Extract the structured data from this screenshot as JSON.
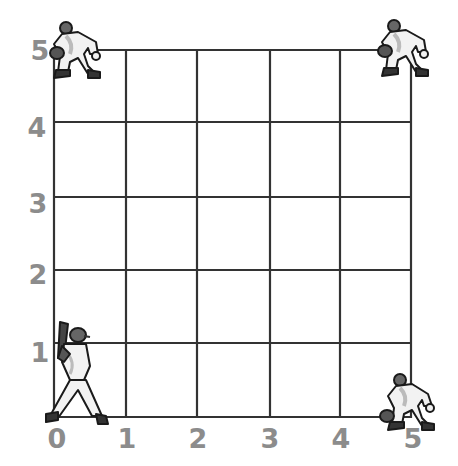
{
  "diagram": {
    "type": "coordinate-grid",
    "grid": {
      "x_min": 0,
      "x_max": 5,
      "y_min": 0,
      "y_max": 5,
      "line_color": "#333333",
      "label_color": "#8c8c8c"
    },
    "x_labels": [
      "0",
      "1",
      "2",
      "3",
      "4",
      "5"
    ],
    "y_labels": [
      "1",
      "2",
      "3",
      "4",
      "5"
    ],
    "players": [
      {
        "role": "batter",
        "x": 0,
        "y": 0
      },
      {
        "role": "fielder",
        "x": 0,
        "y": 5
      },
      {
        "role": "fielder",
        "x": 5,
        "y": 5
      },
      {
        "role": "fielder",
        "x": 5,
        "y": 0
      }
    ]
  }
}
